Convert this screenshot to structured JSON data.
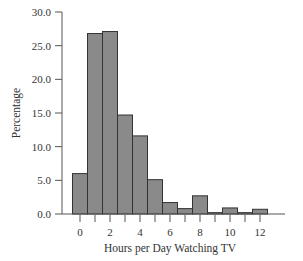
{
  "chart_data": {
    "type": "bar",
    "title": "",
    "xlabel": "Hours per Day Watching TV",
    "ylabel": "Percentage",
    "categories": [
      0,
      1,
      2,
      3,
      4,
      5,
      6,
      7,
      8,
      9,
      10,
      11,
      12
    ],
    "values": [
      6.0,
      26.8,
      27.1,
      14.7,
      11.6,
      5.1,
      1.7,
      0.8,
      2.7,
      0.2,
      0.9,
      0.2,
      0.7
    ],
    "ylim": [
      0,
      30
    ],
    "yticks": [
      "0.0",
      "5.0",
      "10.0",
      "15.0",
      "20.0",
      "25.0",
      "30.0"
    ],
    "xticks": [
      "0",
      "2",
      "4",
      "6",
      "8",
      "10",
      "12"
    ],
    "grid": false,
    "legend": null,
    "bar_color": "#8a8a8a",
    "edge_color": "#333333"
  }
}
